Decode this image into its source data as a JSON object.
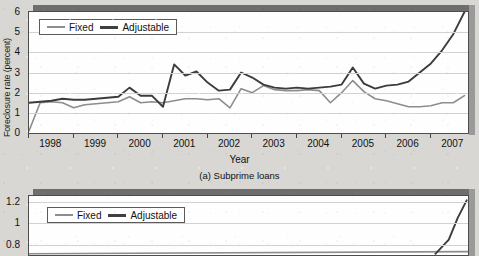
{
  "background_color": "#d8d7d3",
  "chart_data": [
    {
      "id": "subprime",
      "type": "line",
      "title": "",
      "caption": "(a) Subprime loans",
      "xlabel": "Year",
      "ylabel": "Foreclosure rate (percent)",
      "xlim": [
        1998,
        2007.83
      ],
      "ylim": [
        0,
        6
      ],
      "yticks": [
        "0",
        "1",
        "2",
        "3",
        "4",
        "5",
        "6"
      ],
      "ytick_values": [
        0,
        1,
        2,
        3,
        4,
        5,
        6
      ],
      "xticks": [
        "1998",
        "1999",
        "2000",
        "2001",
        "2002",
        "2003",
        "2004",
        "2005",
        "2006",
        "2007"
      ],
      "xtick_values": [
        1998,
        1999,
        2000,
        2001,
        2002,
        2003,
        2004,
        2005,
        2006,
        2007
      ],
      "grid": true,
      "legend_position": "top-left",
      "series": [
        {
          "name": "Fixed",
          "color": "#8d8d8d",
          "x": [
            1998.0,
            1998.25,
            1998.5,
            1998.75,
            1999.0,
            1999.25,
            1999.5,
            1999.75,
            2000.0,
            2000.25,
            2000.5,
            2000.75,
            2001.0,
            2001.25,
            2001.5,
            2001.75,
            2002.0,
            2002.25,
            2002.5,
            2002.75,
            2003.0,
            2003.25,
            2003.5,
            2003.75,
            2004.0,
            2004.25,
            2004.5,
            2004.75,
            2005.0,
            2005.25,
            2005.5,
            2005.75,
            2006.0,
            2006.25,
            2006.5,
            2006.75,
            2007.0,
            2007.25,
            2007.5,
            2007.75
          ],
          "values": [
            0.1,
            1.5,
            1.55,
            1.5,
            1.25,
            1.4,
            1.45,
            1.5,
            1.55,
            1.8,
            1.5,
            1.55,
            1.5,
            1.6,
            1.7,
            1.7,
            1.65,
            1.7,
            1.25,
            2.2,
            2.0,
            2.35,
            2.15,
            2.1,
            2.1,
            2.15,
            2.1,
            1.5,
            2.0,
            2.6,
            2.05,
            1.7,
            1.6,
            1.45,
            1.3,
            1.3,
            1.35,
            1.5,
            1.5,
            1.85
          ]
        },
        {
          "name": "Adjustable",
          "color": "#3c3c3c",
          "x": [
            1998.0,
            1998.25,
            1998.5,
            1998.75,
            1999.0,
            1999.25,
            1999.5,
            1999.75,
            2000.0,
            2000.25,
            2000.5,
            2000.75,
            2001.0,
            2001.25,
            2001.5,
            2001.75,
            2002.0,
            2002.25,
            2002.5,
            2002.75,
            2003.0,
            2003.25,
            2003.5,
            2003.75,
            2004.0,
            2004.25,
            2004.5,
            2004.75,
            2005.0,
            2005.25,
            2005.5,
            2005.75,
            2006.0,
            2006.25,
            2006.5,
            2006.75,
            2007.0,
            2007.25,
            2007.5,
            2007.75
          ],
          "values": [
            1.5,
            1.55,
            1.6,
            1.7,
            1.65,
            1.65,
            1.7,
            1.75,
            1.8,
            2.25,
            1.85,
            1.85,
            1.3,
            3.4,
            2.85,
            3.05,
            2.5,
            2.1,
            2.15,
            3.0,
            2.75,
            2.4,
            2.25,
            2.2,
            2.25,
            2.2,
            2.25,
            2.3,
            2.4,
            3.25,
            2.45,
            2.2,
            2.35,
            2.4,
            2.55,
            3.0,
            3.45,
            4.1,
            4.9,
            6.0
          ]
        }
      ],
      "legend": [
        {
          "label": "Fixed",
          "color": "#8d8d8d",
          "style": "thin"
        },
        {
          "label": "Adjustable",
          "color": "#3c3c3c",
          "style": "thick"
        }
      ]
    },
    {
      "id": "prime",
      "type": "line",
      "title": "",
      "caption": "",
      "xlabel": "",
      "ylabel": "e (percent)",
      "ylim": [
        0.7,
        1.25
      ],
      "yticks": [
        "1.2",
        "1",
        "0.8"
      ],
      "ytick_values": [
        1.2,
        1.0,
        0.8
      ],
      "grid": true,
      "legend_position": "top-left",
      "truncated": true,
      "series": [
        {
          "name": "Fixed",
          "color": "#8d8d8d",
          "x": [
            1998,
            2007.83
          ],
          "values": [
            0.72,
            0.74
          ]
        },
        {
          "name": "Adjustable",
          "color": "#3c3c3c",
          "x": [
            2007.1,
            2007.4,
            2007.6,
            2007.8
          ],
          "values": [
            0.72,
            0.85,
            1.05,
            1.21
          ]
        }
      ],
      "legend": [
        {
          "label": "Fixed",
          "color": "#8d8d8d",
          "style": "thin"
        },
        {
          "label": "Adjustable",
          "color": "#3c3c3c",
          "style": "thick"
        }
      ]
    }
  ]
}
